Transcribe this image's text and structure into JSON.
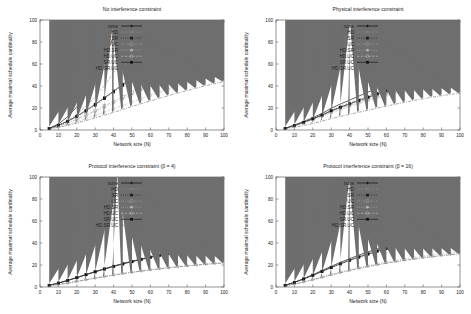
{
  "figure": {
    "background": "#ffffff",
    "layout": "2x2 grid of line charts",
    "shared_xlabel": "Network size (N)",
    "shared_ylabel": "Average maximal schedule cardinality"
  },
  "series_style": {
    "none": {
      "color": "#000000",
      "marker": "plus",
      "dash": "none"
    },
    "HD": {
      "color": "#8c8c8c",
      "marker": "cross",
      "dash": "dash"
    },
    "SR": {
      "color": "#1a1a1a",
      "marker": "square",
      "dash": "dot"
    },
    "UC": {
      "color": "#9a9a9a",
      "marker": "osquare",
      "dash": "dashdot"
    },
    "HD.SR": {
      "color": "#b5b5b5",
      "marker": "circle",
      "dash": "dot"
    },
    "HD.UC": {
      "color": "#c0c0c0",
      "marker": "ocircle",
      "dash": "dash"
    },
    "SR.UC": {
      "color": "#111111",
      "marker": "fsquare",
      "dash": "solid"
    },
    "HD.SR.UC": {
      "color": "#6e6e6e",
      "marker": "triangle",
      "dash": "dashdot"
    }
  },
  "chart_data": [
    {
      "type": "line",
      "panel": "top-left",
      "title": "No interference constraint",
      "xlabel": "Network size (N)",
      "ylabel": "Average maximal schedule cardinality",
      "xlim": [
        0,
        100
      ],
      "ylim": [
        0,
        100
      ],
      "xticks": [
        0,
        10,
        20,
        30,
        40,
        50,
        60,
        70,
        80,
        90,
        100
      ],
      "yticks": [
        0,
        20,
        40,
        60,
        80,
        100
      ],
      "grid": false,
      "legend_position": "upper-left-inside",
      "x": [
        5,
        10,
        15,
        20,
        25,
        30,
        35,
        40,
        45,
        50,
        55,
        60,
        65,
        70,
        75,
        80,
        85,
        90,
        95,
        100
      ],
      "series": [
        {
          "name": "none",
          "values": [
            1.6,
            5.5,
            12.0,
            21.0,
            33.0,
            47.5,
            65.0,
            85.0,
            100,
            100,
            100,
            100,
            100,
            100,
            100,
            100,
            100,
            100,
            100,
            100
          ]
        },
        {
          "name": "HD",
          "values": [
            1.3,
            4.0,
            8.4,
            14.2,
            21.5,
            30.2,
            40.3,
            51.8,
            64.5,
            78.5,
            93.5,
            100,
            100,
            100,
            100,
            100,
            100,
            100,
            100,
            100
          ]
        },
        {
          "name": "SR",
          "values": [
            1.4,
            4.2,
            7.6,
            12.0,
            17.0,
            22.5,
            28.5,
            34.5,
            40.5,
            46.5,
            52.5,
            58.5,
            64.5,
            70.0,
            76.0,
            81.5,
            87.0,
            92.0,
            96.0,
            99.5
          ]
        },
        {
          "name": "UC",
          "values": [
            1.3,
            3.6,
            6.4,
            9.8,
            13.6,
            17.6,
            21.8,
            26.0,
            30.3,
            34.6,
            38.8,
            43.0,
            47.2,
            51.2,
            55.2,
            59.0,
            62.8,
            66.5,
            70.0,
            73.5
          ]
        },
        {
          "name": "HD.SR",
          "values": [
            1.2,
            3.4,
            6.0,
            9.2,
            12.8,
            16.6,
            20.5,
            24.5,
            28.5,
            32.5,
            36.5,
            40.4,
            44.2,
            48.0,
            51.6,
            55.2,
            58.6,
            62.0,
            65.2,
            68.2
          ]
        },
        {
          "name": "HD.UC",
          "values": [
            1.1,
            2.8,
            5.0,
            7.5,
            10.3,
            13.2,
            16.2,
            19.3,
            22.4,
            25.5,
            28.6,
            31.6,
            34.6,
            37.5,
            40.3,
            43.0,
            45.6,
            48.2,
            50.6,
            53.0
          ]
        },
        {
          "name": "SR.UC",
          "values": [
            1.4,
            4.4,
            8.0,
            12.6,
            17.8,
            23.4,
            29.3,
            35.4,
            41.6,
            47.8,
            54.0,
            60.0,
            66.0,
            71.8,
            77.5,
            83.0,
            88.2,
            93.0,
            97.0,
            100
          ]
        },
        {
          "name": "HD.SR.UC",
          "values": [
            1.0,
            2.4,
            4.2,
            6.3,
            8.6,
            11.0,
            13.5,
            16.1,
            18.7,
            21.3,
            23.9,
            26.4,
            28.9,
            31.3,
            33.6,
            35.9,
            38.1,
            40.2,
            42.2,
            44.0
          ]
        }
      ]
    },
    {
      "type": "line",
      "panel": "top-right",
      "title": "Physical interference constraint",
      "xlabel": "Network size (N)",
      "ylabel": "Average maximal schedule cardinality",
      "xlim": [
        0,
        100
      ],
      "ylim": [
        0,
        100
      ],
      "xticks": [
        0,
        10,
        20,
        30,
        40,
        50,
        60,
        70,
        80,
        90,
        100
      ],
      "yticks": [
        0,
        20,
        40,
        60,
        80,
        100
      ],
      "grid": false,
      "legend_position": "upper-left-inside",
      "x": [
        5,
        10,
        15,
        20,
        25,
        30,
        35,
        40,
        45,
        50,
        55,
        60,
        65,
        70,
        75,
        80,
        85,
        90,
        95,
        100
      ],
      "series": [
        {
          "name": "none",
          "values": [
            1.6,
            4.5,
            7.8,
            11.2,
            15.0,
            19.8,
            23.6,
            27.2,
            30.8,
            34.4,
            38.0,
            41.6,
            45.0,
            48.4,
            51.8,
            55.0,
            58.2,
            61.0,
            63.6,
            66.0
          ]
        },
        {
          "name": "HD",
          "values": [
            1.5,
            4.2,
            7.2,
            10.4,
            14.0,
            18.2,
            21.6,
            24.8,
            28.0,
            31.2,
            34.4,
            37.5,
            40.6,
            43.6,
            46.5,
            49.2,
            51.8,
            54.2,
            56.4,
            58.5
          ]
        },
        {
          "name": "SR",
          "values": [
            1.5,
            4.1,
            7.0,
            10.2,
            13.6,
            17.6,
            20.8,
            23.9,
            27.0,
            30.0,
            33.0,
            35.9,
            38.8,
            41.6,
            44.3,
            46.8,
            49.2,
            51.4,
            53.4,
            55.2
          ]
        },
        {
          "name": "UC",
          "values": [
            1.4,
            3.9,
            6.7,
            9.7,
            13.0,
            16.8,
            19.8,
            22.7,
            25.6,
            28.4,
            31.1,
            33.8,
            36.4,
            38.9,
            41.3,
            43.6,
            45.7,
            47.7,
            49.4,
            51.0
          ]
        },
        {
          "name": "HD.SR",
          "values": [
            1.4,
            3.8,
            6.5,
            9.4,
            12.6,
            16.2,
            19.1,
            21.9,
            24.7,
            27.4,
            30.0,
            32.6,
            35.1,
            37.5,
            39.8,
            42.0,
            44.1,
            46.0,
            47.7,
            49.2
          ]
        },
        {
          "name": "HD.UC",
          "values": [
            1.3,
            3.7,
            6.3,
            9.1,
            12.2,
            15.7,
            18.5,
            21.2,
            23.9,
            26.5,
            29.0,
            31.5,
            33.9,
            36.2,
            38.4,
            40.5,
            42.5,
            44.3,
            46.0,
            47.5
          ]
        },
        {
          "name": "SR.UC",
          "values": [
            1.5,
            4.1,
            7.0,
            10.1,
            13.5,
            17.4,
            20.6,
            23.7,
            26.7,
            29.7,
            32.6,
            35.5,
            38.3,
            41.0,
            43.6,
            46.1,
            48.4,
            50.6,
            52.6,
            54.4
          ]
        },
        {
          "name": "HD.SR.UC",
          "values": [
            1.0,
            2.5,
            4.2,
            6.0,
            8.0,
            10.4,
            12.3,
            14.2,
            16.1,
            18.0,
            19.9,
            21.7,
            23.5,
            25.2,
            26.9,
            28.4,
            29.9,
            31.2,
            32.4,
            33.4
          ]
        }
      ]
    },
    {
      "type": "line",
      "panel": "bottom-left",
      "title": "Protocol interference constraint (β = 4)",
      "xlabel": "Network size (N)",
      "ylabel": "Average maximal schedule cardinality",
      "xlim": [
        0,
        100
      ],
      "ylim": [
        0,
        100
      ],
      "xticks": [
        0,
        10,
        20,
        30,
        40,
        50,
        60,
        70,
        80,
        90,
        100
      ],
      "yticks": [
        0,
        20,
        40,
        60,
        80,
        100
      ],
      "grid": false,
      "legend_position": "upper-left-inside",
      "x": [
        5,
        10,
        15,
        20,
        25,
        30,
        35,
        40,
        45,
        50,
        55,
        60,
        65,
        70,
        75,
        80,
        85,
        90,
        95,
        100
      ],
      "series": [
        {
          "name": "none",
          "values": [
            1.5,
            3.6,
            6.0,
            8.6,
            11.3,
            14.0,
            16.6,
            19.0,
            21.3,
            23.4,
            25.4,
            27.3,
            29.1,
            30.8,
            32.4,
            33.9,
            35.3,
            36.6,
            37.9,
            39.8
          ]
        },
        {
          "name": "HD",
          "values": [
            1.5,
            3.6,
            6.0,
            8.6,
            11.3,
            14.0,
            16.6,
            19.0,
            21.3,
            23.4,
            25.4,
            27.3,
            29.1,
            30.8,
            32.4,
            33.9,
            35.3,
            36.6,
            37.9,
            39.6
          ]
        },
        {
          "name": "SR",
          "values": [
            1.5,
            3.5,
            5.9,
            8.5,
            11.2,
            13.9,
            16.4,
            18.8,
            21.1,
            23.2,
            25.2,
            27.1,
            28.9,
            30.6,
            32.2,
            33.7,
            35.1,
            36.4,
            37.7,
            39.4
          ]
        },
        {
          "name": "UC",
          "values": [
            1.5,
            3.5,
            5.9,
            8.5,
            11.2,
            13.8,
            16.3,
            18.7,
            21.0,
            23.1,
            25.1,
            27.0,
            28.8,
            30.5,
            32.1,
            33.6,
            35.0,
            36.3,
            37.6,
            39.2
          ]
        },
        {
          "name": "HD.SR",
          "values": [
            1.0,
            2.2,
            3.6,
            5.1,
            6.6,
            8.1,
            9.6,
            11.0,
            12.3,
            13.5,
            14.6,
            15.7,
            16.7,
            17.6,
            18.5,
            19.3,
            20.1,
            20.8,
            21.5,
            22.1
          ]
        },
        {
          "name": "HD.UC",
          "values": [
            1.0,
            2.2,
            3.6,
            5.1,
            6.6,
            8.1,
            9.5,
            10.9,
            12.2,
            13.4,
            14.5,
            15.6,
            16.6,
            17.5,
            18.4,
            19.2,
            20.0,
            20.7,
            21.4,
            22.0
          ]
        },
        {
          "name": "SR.UC",
          "values": [
            1.5,
            3.5,
            5.9,
            8.5,
            11.2,
            13.8,
            16.3,
            18.7,
            21.0,
            23.1,
            25.1,
            27.0,
            28.8,
            30.5,
            32.1,
            33.6,
            35.0,
            36.3,
            37.6,
            39.3
          ]
        },
        {
          "name": "HD.SR.UC",
          "values": [
            1.0,
            2.2,
            3.5,
            5.0,
            6.5,
            8.0,
            9.4,
            10.8,
            12.1,
            13.3,
            14.4,
            15.5,
            16.5,
            17.4,
            18.3,
            19.1,
            19.9,
            20.6,
            21.3,
            21.9
          ]
        }
      ]
    },
    {
      "type": "line",
      "panel": "bottom-right",
      "title": "Protocol interference constraint (β = 16)",
      "xlabel": "Network size (N)",
      "ylabel": "Average maximal schedule cardinality",
      "xlim": [
        0,
        100
      ],
      "ylim": [
        0,
        100
      ],
      "xticks": [
        0,
        10,
        20,
        30,
        40,
        50,
        60,
        70,
        80,
        90,
        100
      ],
      "yticks": [
        0,
        20,
        40,
        60,
        80,
        100
      ],
      "grid": false,
      "legend_position": "upper-left-inside",
      "x": [
        5,
        10,
        15,
        20,
        25,
        30,
        35,
        40,
        45,
        50,
        55,
        60,
        65,
        70,
        75,
        80,
        85,
        90,
        95,
        100
      ],
      "series": [
        {
          "name": "none",
          "values": [
            1.6,
            4.3,
            7.6,
            11.2,
            15.0,
            18.8,
            22.4,
            25.8,
            29.0,
            32.0,
            34.8,
            37.4,
            39.8,
            42.1,
            44.2,
            46.2,
            48.0,
            49.7,
            51.2,
            52.6
          ]
        },
        {
          "name": "HD",
          "values": [
            1.6,
            4.2,
            7.5,
            11.0,
            14.7,
            18.4,
            22.0,
            25.3,
            28.4,
            31.3,
            34.0,
            36.6,
            39.0,
            41.2,
            43.3,
            45.2,
            47.0,
            48.6,
            50.1,
            51.5
          ]
        },
        {
          "name": "SR",
          "values": [
            1.5,
            4.1,
            7.3,
            10.7,
            14.3,
            17.9,
            21.4,
            24.6,
            27.6,
            30.4,
            33.0,
            35.5,
            37.8,
            39.9,
            41.9,
            43.8,
            45.5,
            47.1,
            48.5,
            49.8
          ]
        },
        {
          "name": "UC",
          "values": [
            1.5,
            4.1,
            7.2,
            10.6,
            14.2,
            17.7,
            21.1,
            24.3,
            27.3,
            30.1,
            32.7,
            35.1,
            37.4,
            39.5,
            41.5,
            43.3,
            45.0,
            46.5,
            47.9,
            49.2
          ]
        },
        {
          "name": "HD.SR",
          "values": [
            1.0,
            2.6,
            4.5,
            6.6,
            8.8,
            11.0,
            13.1,
            15.1,
            17.0,
            18.7,
            20.3,
            21.8,
            23.2,
            24.5,
            25.7,
            26.8,
            27.8,
            28.8,
            29.7,
            30.5
          ]
        },
        {
          "name": "HD.UC",
          "values": [
            1.0,
            2.7,
            4.7,
            6.9,
            9.2,
            11.5,
            13.7,
            15.8,
            17.7,
            19.5,
            21.2,
            22.8,
            24.2,
            25.6,
            26.8,
            28.0,
            29.1,
            30.1,
            31.0,
            31.9
          ]
        },
        {
          "name": "SR.UC",
          "values": [
            1.5,
            4.1,
            7.2,
            10.6,
            14.1,
            17.7,
            21.0,
            24.2,
            27.1,
            29.9,
            32.5,
            34.9,
            37.2,
            39.3,
            41.2,
            43.0,
            44.7,
            46.3,
            47.7,
            49.0
          ]
        },
        {
          "name": "HD.SR.UC",
          "values": [
            1.0,
            2.6,
            4.5,
            6.5,
            8.7,
            10.9,
            13.0,
            14.9,
            16.8,
            18.5,
            20.1,
            21.6,
            22.9,
            24.2,
            25.4,
            26.5,
            27.5,
            28.4,
            29.3,
            30.1
          ]
        }
      ]
    }
  ]
}
